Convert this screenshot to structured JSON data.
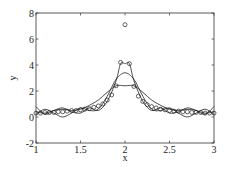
{
  "chart_data": {
    "type": "line",
    "title": "",
    "xlabel": "x",
    "ylabel": "y",
    "xlim": [
      1,
      3
    ],
    "ylim": [
      -2,
      8
    ],
    "xticks": [
      1,
      1.5,
      2,
      2.5,
      3
    ],
    "xtick_labels": [
      "1",
      "1.5",
      "2",
      "2.5",
      "3"
    ],
    "yticks": [
      -2,
      0,
      2,
      4,
      6,
      8
    ],
    "ytick_labels": [
      "-2",
      "0",
      "2",
      "4",
      "6",
      "8"
    ],
    "grid": false,
    "legend": null,
    "series": [
      {
        "name": "data points",
        "style": "circle-markers",
        "x": [
          1.0,
          1.05,
          1.1,
          1.15,
          1.2,
          1.25,
          1.3,
          1.35,
          1.4,
          1.45,
          1.5,
          1.55,
          1.6,
          1.65,
          1.7,
          1.75,
          1.8,
          1.85,
          1.9,
          1.95,
          2.0,
          2.05,
          2.1,
          2.15,
          2.2,
          2.25,
          2.3,
          2.35,
          2.4,
          2.45,
          2.5,
          2.55,
          2.6,
          2.65,
          2.7,
          2.75,
          2.8,
          2.85,
          2.9,
          2.95,
          3.0
        ],
        "y": [
          0.3,
          0.3,
          0.35,
          0.35,
          0.35,
          0.4,
          0.4,
          0.45,
          0.5,
          0.5,
          0.55,
          0.6,
          0.65,
          0.75,
          0.85,
          1.0,
          1.3,
          1.7,
          2.4,
          4.2,
          7.1,
          4.1,
          2.35,
          1.6,
          1.2,
          0.95,
          0.8,
          0.7,
          0.6,
          0.55,
          0.5,
          0.45,
          0.45,
          0.4,
          0.4,
          0.35,
          0.35,
          0.35,
          0.3,
          0.3,
          0.3
        ]
      },
      {
        "name": "fit (narrow peak)",
        "style": "solid-line",
        "peak": 4.1,
        "x": [
          1.0,
          1.1,
          1.2,
          1.3,
          1.4,
          1.5,
          1.6,
          1.7,
          1.8,
          1.9,
          1.95,
          2.0,
          2.05,
          2.1,
          2.2,
          2.3,
          2.4,
          2.5,
          2.6,
          2.7,
          2.8,
          2.9,
          3.0
        ],
        "y": [
          0.8,
          0.2,
          0.5,
          0.7,
          0.4,
          0.3,
          0.7,
          0.5,
          1.2,
          2.8,
          4.1,
          4.1,
          4.1,
          2.8,
          1.2,
          0.5,
          0.7,
          0.3,
          0.4,
          0.7,
          0.5,
          0.2,
          0.8
        ]
      },
      {
        "name": "fit (medium peak)",
        "style": "solid-line",
        "peak": 3.4,
        "x": [
          1.0,
          1.1,
          1.2,
          1.3,
          1.4,
          1.5,
          1.6,
          1.7,
          1.8,
          1.9,
          2.0,
          2.1,
          2.2,
          2.3,
          2.4,
          2.5,
          2.6,
          2.7,
          2.8,
          2.9,
          3.0
        ],
        "y": [
          0.2,
          0.6,
          0.3,
          0.0,
          0.3,
          0.7,
          0.5,
          0.6,
          1.6,
          2.9,
          3.4,
          2.9,
          1.6,
          0.6,
          0.5,
          0.7,
          0.3,
          0.0,
          0.3,
          0.6,
          0.2
        ],
        "note": "oscillates about 0.3 on tails"
      },
      {
        "name": "fit (broad peak)",
        "style": "solid-line",
        "peak": 2.4,
        "x": [
          1.0,
          1.1,
          1.2,
          1.3,
          1.4,
          1.5,
          1.6,
          1.7,
          1.8,
          1.9,
          2.0,
          2.1,
          2.2,
          2.3,
          2.4,
          2.5,
          2.6,
          2.7,
          2.8,
          2.9,
          3.0
        ],
        "y": [
          0.4,
          0.3,
          0.5,
          0.6,
          0.5,
          0.6,
          0.9,
          1.3,
          1.9,
          2.4,
          2.4,
          2.4,
          1.9,
          1.3,
          0.9,
          0.6,
          0.5,
          0.6,
          0.5,
          0.3,
          0.4
        ]
      }
    ]
  }
}
